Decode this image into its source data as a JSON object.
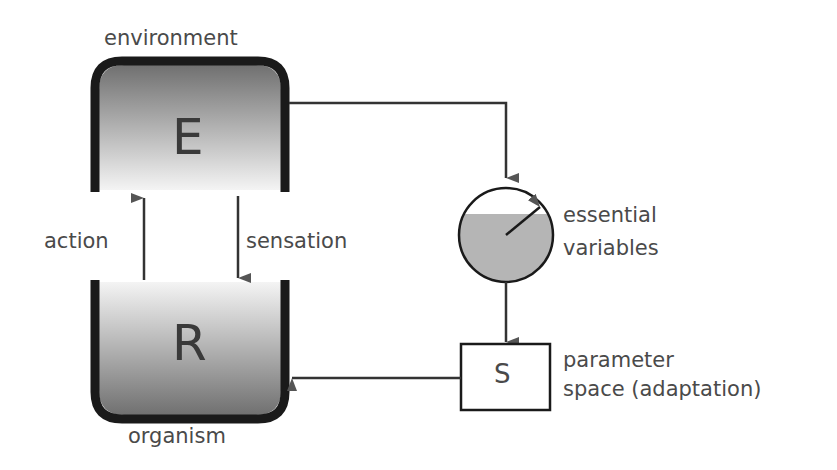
{
  "diagram": {
    "environment": {
      "label": "environment",
      "symbol": "E"
    },
    "organism": {
      "label": "organism",
      "symbol": "R"
    },
    "action_label": "action",
    "sensation_label": "sensation",
    "essential_variables": {
      "line1": "essential",
      "line2": "variables"
    },
    "parameter_space": {
      "symbol": "S",
      "line1": "parameter",
      "line2": "space (adaptation)"
    },
    "colors": {
      "frame": "#1a1a1a",
      "fill_dark": "#6e6e6e",
      "fill_light": "#f2f2f2",
      "text": "#4a4a4a"
    }
  }
}
